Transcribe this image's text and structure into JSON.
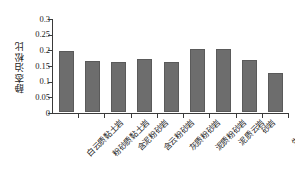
{
  "chart_data": {
    "type": "bar",
    "title": "",
    "xlabel": "",
    "ylabel": "静态泊松比",
    "categories": [
      "白云质黏土岩",
      "粉砂质黏土岩",
      "含泥粉砂岩",
      "含云粉砂岩",
      "灰质粉砂岩",
      "泥质粉砂岩",
      "泥质云岩",
      "砂岩",
      "生物灰岩"
    ],
    "values": [
      0.195,
      0.162,
      0.159,
      0.17,
      0.161,
      0.202,
      0.201,
      0.167,
      0.126
    ],
    "ylim": [
      0,
      0.3
    ],
    "ytick_labels": [
      "0",
      "0.05",
      "0.1",
      "0.15",
      "0.2",
      "0.25",
      "0.3"
    ],
    "ytick_values": [
      0,
      0.05,
      0.1,
      0.15,
      0.2,
      0.25,
      0.3
    ],
    "grid": false,
    "legend": null,
    "bar_color": "#6d6d6d",
    "bar_edge_color": "#5a5a5a",
    "axis_color": "#3a3a3a",
    "background": "#ffffff"
  }
}
